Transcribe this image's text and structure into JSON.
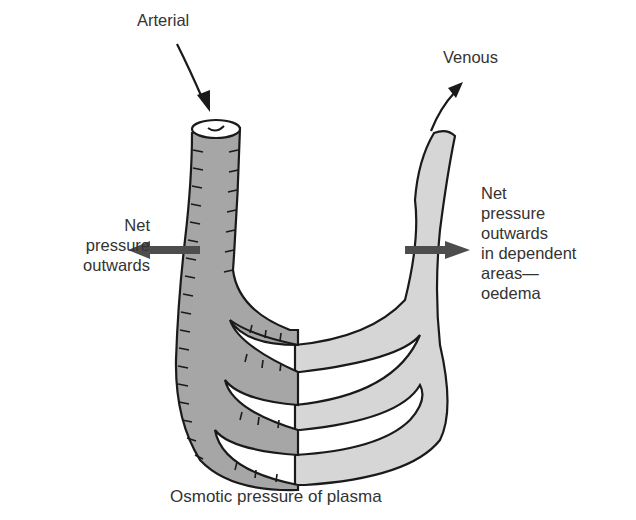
{
  "diagram": {
    "labels": {
      "arterial": "Arterial",
      "venous": "Venous",
      "left_outward": [
        "Net",
        "pressure",
        "outwards"
      ],
      "right_outward": [
        "Net",
        "pressure",
        "outwards",
        "in dependent",
        "areas—",
        "oedema"
      ],
      "caption": "Osmotic pressure of plasma"
    },
    "colors": {
      "arterial_fill": "#a6a6a6",
      "venous_fill": "#d6d6d6",
      "outline": "#1a1a1a",
      "arrow_fill": "#4d4d4d",
      "text": "#333333",
      "background": "#ffffff"
    },
    "icons": {
      "arterial_flow": "arrow-down-icon",
      "venous_flow": "arrow-up-right-icon",
      "left_pressure": "arrow-left-icon",
      "right_pressure": "arrow-right-icon"
    }
  }
}
